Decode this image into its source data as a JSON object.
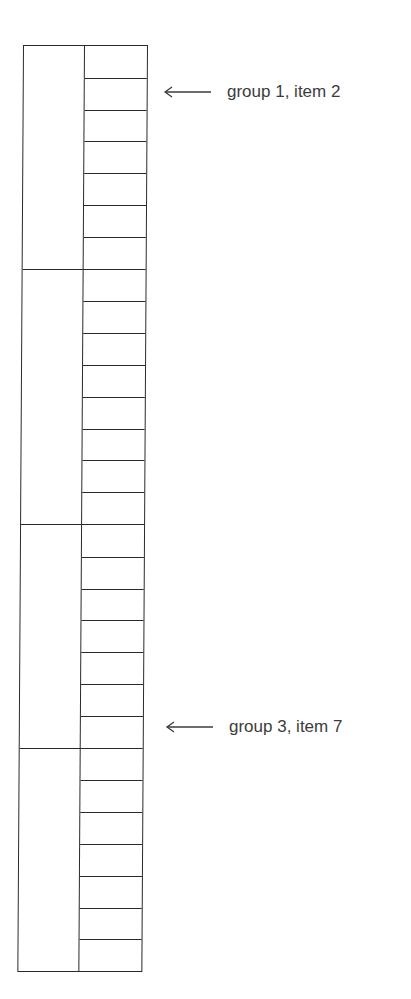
{
  "diagram": {
    "type": "grouped-stack",
    "groups": [
      {
        "name": "group 1",
        "item_count": 7
      },
      {
        "name": "group 2",
        "item_count": 8
      },
      {
        "name": "group 3",
        "item_count": 7
      },
      {
        "name": "group 4",
        "item_count": 7
      }
    ],
    "annotations": [
      {
        "label": "group 1, item 2",
        "group": 1,
        "item": 2,
        "arrow": "left-arrow"
      },
      {
        "label": "group 3, item 7",
        "group": 3,
        "item": 7,
        "arrow": "left-arrow"
      }
    ],
    "colors": {
      "line": "#2a2a2a",
      "text": "#3c3c3c",
      "background": "#ffffff"
    }
  }
}
